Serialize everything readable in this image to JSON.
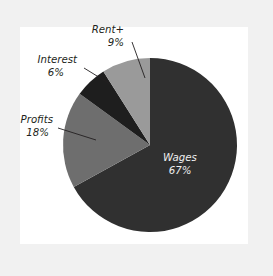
{
  "figure": {
    "name": "income-distribution-pie",
    "background_color": "#f1f1f1",
    "panel_color": "#ffffff"
  },
  "chart_data": {
    "type": "pie",
    "title": "",
    "subtitle": "",
    "xlabel": "",
    "ylabel": "",
    "legend_position": "none",
    "grid": false,
    "label_format": "name + percent",
    "start_angle_deg": 0,
    "direction": "clockwise",
    "categories": [
      "Wages",
      "Profits",
      "Interest",
      "Rent+"
    ],
    "values": [
      67,
      18,
      6,
      9
    ],
    "unit": "%",
    "colors": [
      "#303030",
      "#6e6e6e",
      "#1e1e1e",
      "#9a9a9a"
    ],
    "slices": [
      {
        "name": "Wages",
        "value": 67,
        "label": "Wages",
        "percent_label": "67%",
        "color": "#303030",
        "label_placement": "inside",
        "label_color": "#efefef",
        "start_deg": 0,
        "end_deg": 241.2
      },
      {
        "name": "Profits",
        "value": 18,
        "label": "Profits",
        "percent_label": "18%",
        "color": "#6e6e6e",
        "label_placement": "outside",
        "label_color": "#231f20",
        "start_deg": 241.2,
        "end_deg": 306.0
      },
      {
        "name": "Interest",
        "value": 6,
        "label": "Interest",
        "percent_label": "6%",
        "color": "#1e1e1e",
        "label_placement": "outside",
        "label_color": "#231f20",
        "start_deg": 306.0,
        "end_deg": 327.6
      },
      {
        "name": "Rent+",
        "value": 9,
        "label": "Rent+",
        "percent_label": "9%",
        "color": "#9a9a9a",
        "label_placement": "outside",
        "label_color": "#231f20",
        "start_deg": 327.6,
        "end_deg": 360.0
      }
    ]
  }
}
